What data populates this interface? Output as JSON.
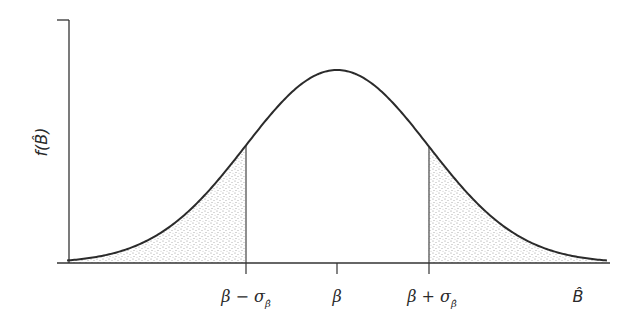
{
  "chart_data": {
    "type": "area",
    "title": "",
    "xlabel": "B̂",
    "ylabel": "f(B̂)",
    "x_ticks": [
      {
        "value": -1,
        "label": "β − σ",
        "sub": "β̂"
      },
      {
        "value": 0,
        "label": "β",
        "sub": ""
      },
      {
        "value": 1,
        "label": "β + σ",
        "sub": "β̂"
      }
    ],
    "mean": 0,
    "sd": 1,
    "x_range": [
      -2.95,
      2.95
    ],
    "shaded_regions": [
      [
        -2.95,
        -1
      ],
      [
        1,
        2.95
      ]
    ],
    "shading": "stipple",
    "grid": false,
    "legend": null
  },
  "labels": {
    "y_axis": "f(B̂)",
    "x_axis": "B̂",
    "tick_minus_main": "β − σ",
    "tick_minus_sub": "β̂",
    "tick_center": "β",
    "tick_plus_main": "β + σ",
    "tick_plus_sub": "β̂"
  },
  "colors": {
    "curve": "#2b2b2b",
    "axis": "#333333",
    "stipple": "#8a8a8a",
    "background": "#ffffff"
  }
}
